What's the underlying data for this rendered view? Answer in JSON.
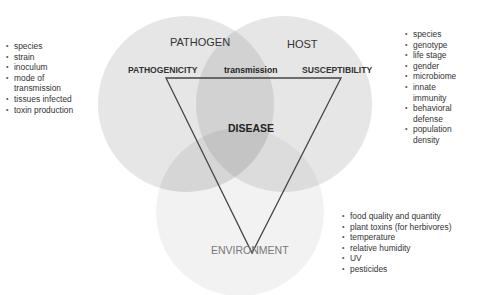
{
  "diagram": {
    "type": "disease triangle venn diagram",
    "circles": [
      {
        "id": "pathogen",
        "label": "PATHOGEN",
        "cx": 186,
        "cy": 104,
        "r": 88,
        "color": "#e3e3e3"
      },
      {
        "id": "host",
        "label": "HOST",
        "cx": 284,
        "cy": 104,
        "r": 88,
        "color": "#e3e3e3"
      },
      {
        "id": "environment",
        "label": "ENVIRONMENT",
        "cx": 240,
        "cy": 212,
        "r": 84,
        "color": "#efefef"
      }
    ],
    "triangle": {
      "vertices": {
        "top_left": "PATHOGENICITY",
        "top_right": "SUSCEPTIBILITY",
        "bottom": ""
      },
      "edge_label_top": "transmission",
      "center_label": "DISEASE",
      "stroke": "#444444"
    },
    "labels": {
      "pathogen": "PATHOGEN",
      "host": "HOST",
      "environment": "ENVIRONMENT",
      "pathogenicity": "PATHOGENICITY",
      "susceptibility": "SUSCEPTIBILITY",
      "transmission": "transmission",
      "disease": "DISEASE"
    },
    "lists": {
      "pathogen_factors": [
        "species",
        "strain",
        "inoculum",
        "mode of transmission",
        "tissues infected",
        "toxin production"
      ],
      "host_factors": [
        "species",
        "genotype",
        "life stage",
        "gender",
        "microbiome",
        "innate immunity",
        "behavioral defense",
        "population density"
      ],
      "environment_factors": [
        "food quality and quantity",
        "plant toxins (for herbivores)",
        "temperature",
        "relative humidity",
        "UV",
        "pesticides"
      ]
    }
  }
}
